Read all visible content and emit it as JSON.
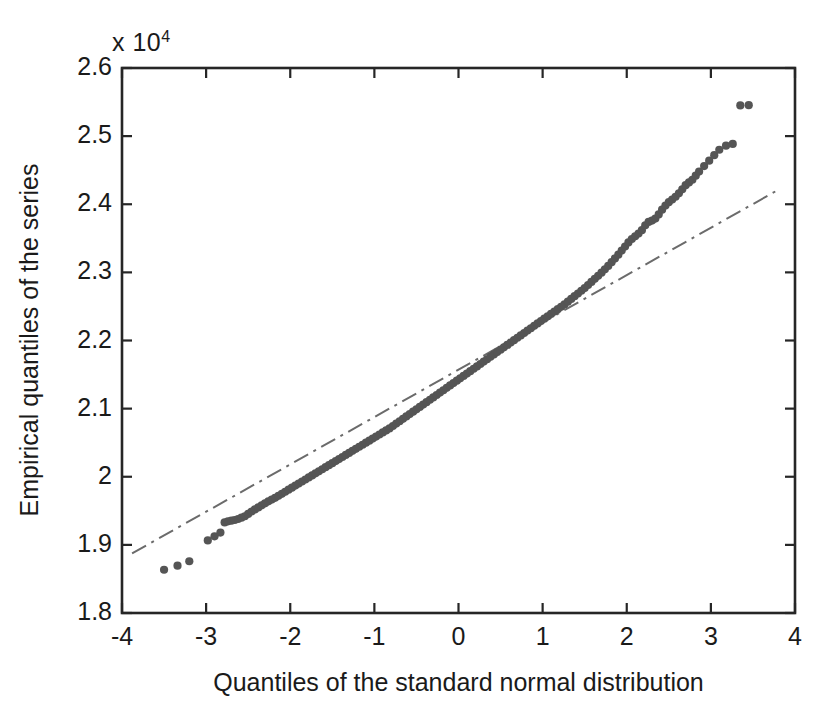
{
  "chart_data": {
    "type": "scatter",
    "title": "",
    "subtitle": "",
    "xlabel": "Quantiles of the standard normal distribution",
    "ylabel": "Empirical quantiles of the series",
    "y_axis_multiplier": "x 10",
    "y_axis_multiplier_exponent": "4",
    "y_scale_factor": 10000,
    "xlim": [
      -4,
      4
    ],
    "ylim": [
      1.8,
      2.6
    ],
    "xticks": [
      -4,
      -3,
      -2,
      -1,
      0,
      1,
      2,
      3,
      4
    ],
    "xtick_labels": [
      "-4",
      "-3",
      "-2",
      "-1",
      "0",
      "1",
      "2",
      "3",
      "4"
    ],
    "yticks": [
      1.8,
      1.9,
      2.0,
      2.1,
      2.2,
      2.3,
      2.4,
      2.5,
      2.6
    ],
    "ytick_labels": [
      "1.8",
      "1.9",
      "2",
      "2.1",
      "2.2",
      "2.3",
      "2.4",
      "2.5",
      "2.6"
    ],
    "grid": false,
    "legend": null,
    "box": true,
    "tick_direction": "in",
    "marker_color": "#555555",
    "marker_size": 6,
    "reference_line": {
      "style": "dash-dot",
      "color": "#6b6b6b",
      "width": 2,
      "x_start": -3.88,
      "y_start": 1.8875,
      "x_end": 3.82,
      "y_end": 2.4225
    },
    "annotations": [
      "Lower tail: 3 isolated points fall below the reference line near x = -3.5 to -3.2",
      "Upper tail: points rise above the reference line beyond x = 2, ending in 2 isolated outliers near x = 3.35 and x = 3.45 at y = 2.545e4"
    ],
    "points": [
      [
        -3.5,
        1.8635
      ],
      [
        -3.34,
        1.8695
      ],
      [
        -3.2,
        1.876
      ],
      [
        -2.98,
        1.9065
      ],
      [
        -2.9,
        1.9125
      ],
      [
        -2.83,
        1.918
      ],
      [
        -2.78,
        1.933
      ],
      [
        -2.74,
        1.9345
      ],
      [
        -2.7,
        1.9355
      ],
      [
        -2.66,
        1.9365
      ],
      [
        -2.62,
        1.938
      ],
      [
        -2.58,
        1.94
      ],
      [
        -2.54,
        1.942
      ],
      [
        -2.5,
        1.9455
      ],
      [
        -2.46,
        1.949
      ],
      [
        -2.42,
        1.952
      ],
      [
        -2.38,
        1.955
      ],
      [
        -2.34,
        1.958
      ],
      [
        -2.3,
        1.961
      ],
      [
        -2.26,
        1.964
      ],
      [
        -2.22,
        1.9665
      ],
      [
        -2.18,
        1.969
      ],
      [
        -2.14,
        1.972
      ],
      [
        -2.1,
        1.975
      ],
      [
        -2.06,
        1.978
      ],
      [
        -2.02,
        1.981
      ],
      [
        -1.98,
        1.984
      ],
      [
        -1.94,
        1.987
      ],
      [
        -1.9,
        1.99
      ],
      [
        -1.86,
        1.993
      ],
      [
        -1.82,
        1.996
      ],
      [
        -1.78,
        1.999
      ],
      [
        -1.74,
        2.002
      ],
      [
        -1.7,
        2.005
      ],
      [
        -1.66,
        2.008
      ],
      [
        -1.62,
        2.011
      ],
      [
        -1.58,
        2.014
      ],
      [
        -1.54,
        2.017
      ],
      [
        -1.5,
        2.02
      ],
      [
        -1.46,
        2.023
      ],
      [
        -1.42,
        2.026
      ],
      [
        -1.38,
        2.029
      ],
      [
        -1.34,
        2.032
      ],
      [
        -1.3,
        2.035
      ],
      [
        -1.26,
        2.038
      ],
      [
        -1.22,
        2.041
      ],
      [
        -1.18,
        2.044
      ],
      [
        -1.14,
        2.047
      ],
      [
        -1.1,
        2.05
      ],
      [
        -1.06,
        2.053
      ],
      [
        -1.02,
        2.056
      ],
      [
        -0.98,
        2.059
      ],
      [
        -0.94,
        2.062
      ],
      [
        -0.9,
        2.065
      ],
      [
        -0.86,
        2.068
      ],
      [
        -0.82,
        2.071
      ],
      [
        -0.78,
        2.0745
      ],
      [
        -0.74,
        2.078
      ],
      [
        -0.7,
        2.0815
      ],
      [
        -0.66,
        2.085
      ],
      [
        -0.62,
        2.0885
      ],
      [
        -0.58,
        2.092
      ],
      [
        -0.54,
        2.0955
      ],
      [
        -0.5,
        2.099
      ],
      [
        -0.46,
        2.1025
      ],
      [
        -0.42,
        2.106
      ],
      [
        -0.38,
        2.1095
      ],
      [
        -0.34,
        2.113
      ],
      [
        -0.3,
        2.1165
      ],
      [
        -0.26,
        2.12
      ],
      [
        -0.22,
        2.1235
      ],
      [
        -0.18,
        2.127
      ],
      [
        -0.14,
        2.1305
      ],
      [
        -0.1,
        2.134
      ],
      [
        -0.06,
        2.1375
      ],
      [
        -0.02,
        2.141
      ],
      [
        0.02,
        2.1445
      ],
      [
        0.06,
        2.148
      ],
      [
        0.1,
        2.1515
      ],
      [
        0.14,
        2.155
      ],
      [
        0.18,
        2.1585
      ],
      [
        0.22,
        2.162
      ],
      [
        0.26,
        2.1655
      ],
      [
        0.3,
        2.169
      ],
      [
        0.34,
        2.1725
      ],
      [
        0.38,
        2.176
      ],
      [
        0.42,
        2.1795
      ],
      [
        0.46,
        2.183
      ],
      [
        0.5,
        2.1865
      ],
      [
        0.54,
        2.19
      ],
      [
        0.58,
        2.1935
      ],
      [
        0.62,
        2.197
      ],
      [
        0.66,
        2.2005
      ],
      [
        0.7,
        2.204
      ],
      [
        0.74,
        2.2075
      ],
      [
        0.78,
        2.211
      ],
      [
        0.82,
        2.2145
      ],
      [
        0.86,
        2.218
      ],
      [
        0.9,
        2.2215
      ],
      [
        0.94,
        2.225
      ],
      [
        0.98,
        2.2285
      ],
      [
        1.02,
        2.232
      ],
      [
        1.06,
        2.2355
      ],
      [
        1.1,
        2.239
      ],
      [
        1.14,
        2.2425
      ],
      [
        1.18,
        2.246
      ],
      [
        1.22,
        2.2495
      ],
      [
        1.26,
        2.253
      ],
      [
        1.3,
        2.257
      ],
      [
        1.34,
        2.261
      ],
      [
        1.38,
        2.265
      ],
      [
        1.42,
        2.269
      ],
      [
        1.46,
        2.273
      ],
      [
        1.5,
        2.277
      ],
      [
        1.54,
        2.2815
      ],
      [
        1.58,
        2.286
      ],
      [
        1.62,
        2.2905
      ],
      [
        1.66,
        2.295
      ],
      [
        1.7,
        2.2995
      ],
      [
        1.74,
        2.3045
      ],
      [
        1.78,
        2.3095
      ],
      [
        1.82,
        2.315
      ],
      [
        1.86,
        2.3205
      ],
      [
        1.9,
        2.326
      ],
      [
        1.94,
        2.332
      ],
      [
        1.98,
        2.338
      ],
      [
        2.02,
        2.344
      ],
      [
        2.06,
        2.349
      ],
      [
        2.1,
        2.353
      ],
      [
        2.14,
        2.357
      ],
      [
        2.18,
        2.362
      ],
      [
        2.22,
        2.369
      ],
      [
        2.26,
        2.374
      ],
      [
        2.3,
        2.376
      ],
      [
        2.34,
        2.379
      ],
      [
        2.38,
        2.385
      ],
      [
        2.42,
        2.392
      ],
      [
        2.46,
        2.398
      ],
      [
        2.5,
        2.403
      ],
      [
        2.54,
        2.407
      ],
      [
        2.58,
        2.411
      ],
      [
        2.62,
        2.416
      ],
      [
        2.66,
        2.422
      ],
      [
        2.7,
        2.428
      ],
      [
        2.74,
        2.432
      ],
      [
        2.78,
        2.436
      ],
      [
        2.82,
        2.442
      ],
      [
        2.86,
        2.448
      ],
      [
        2.92,
        2.456
      ],
      [
        2.98,
        2.464
      ],
      [
        3.04,
        2.472
      ],
      [
        3.1,
        2.48
      ],
      [
        3.18,
        2.486
      ],
      [
        3.26,
        2.4885
      ],
      [
        3.35,
        2.545
      ],
      [
        3.45,
        2.5455
      ]
    ]
  }
}
